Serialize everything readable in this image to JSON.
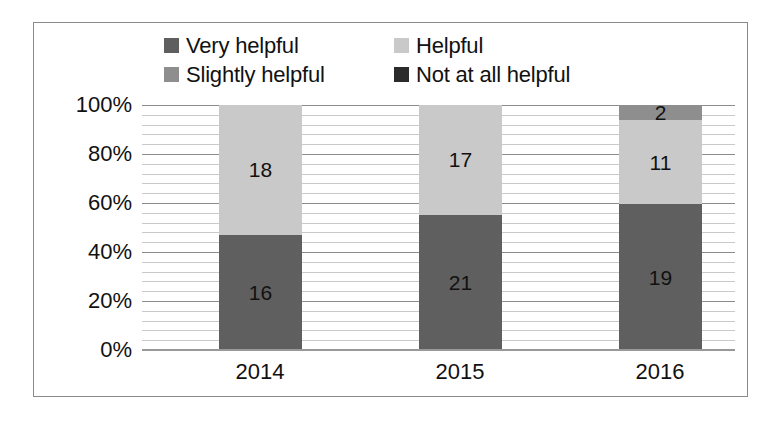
{
  "chart_data": {
    "type": "bar",
    "subtype": "stacked-100-percent",
    "title": "",
    "xlabel": "",
    "ylabel": "",
    "categories": [
      "2014",
      "2015",
      "2016"
    ],
    "ylim": [
      0,
      100
    ],
    "ytick_labels": [
      "0%",
      "20%",
      "40%",
      "60%",
      "80%",
      "100%"
    ],
    "ytick_values": [
      0,
      20,
      40,
      60,
      80,
      100
    ],
    "grid": true,
    "grid_minor": true,
    "legend_position": "top",
    "series": [
      {
        "name": "Very helpful",
        "color": "#5f5f5f",
        "values": [
          16,
          21,
          19
        ],
        "percent": [
          47.1,
          55.3,
          59.4
        ],
        "labels": [
          "16",
          "21",
          "19"
        ]
      },
      {
        "name": "Helpful",
        "color": "#c9c9c9",
        "values": [
          18,
          17,
          11
        ],
        "percent": [
          52.9,
          44.7,
          34.4
        ],
        "labels": [
          "18",
          "17",
          "11"
        ]
      },
      {
        "name": "Slightly helpful",
        "color": "#8e8e8e",
        "values": [
          0,
          0,
          2
        ],
        "percent": [
          0,
          0,
          6.2
        ],
        "labels": [
          "",
          "",
          "2"
        ]
      },
      {
        "name": "Not at all helpful",
        "color": "#2b2b2b",
        "values": [
          0,
          0,
          0
        ],
        "percent": [
          0,
          0,
          0
        ],
        "labels": [
          "",
          "",
          ""
        ]
      }
    ]
  },
  "legend": {
    "items": [
      {
        "label": "Very helpful",
        "color": "#5f5f5f"
      },
      {
        "label": "Helpful",
        "color": "#c9c9c9"
      },
      {
        "label": "Slightly helpful",
        "color": "#8e8e8e"
      },
      {
        "label": "Not at all helpful",
        "color": "#2b2b2b"
      }
    ]
  },
  "axes": {
    "y_ticks": [
      "100%",
      "80%",
      "60%",
      "40%",
      "20%",
      "0%"
    ],
    "x_ticks": [
      "2014",
      "2015",
      "2016"
    ]
  }
}
